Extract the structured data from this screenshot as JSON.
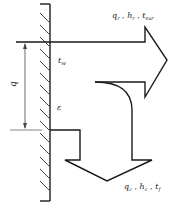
{
  "diagram": {
    "colors": {
      "stroke": "#1a1a1a",
      "hatch": "#333333",
      "dimension": "#444444",
      "background": "#ffffff"
    },
    "labels": {
      "radiation": "qᵣ , hᵣ , tₛᵤᵣ",
      "radiation_parts": {
        "q": "q",
        "q_sub": "r",
        "h": "h",
        "h_sub": "r",
        "t": "t",
        "t_sub": "sur"
      },
      "convection_parts": {
        "q": "q",
        "q_sub": "c",
        "h": "h",
        "h_sub": "c",
        "t": "t",
        "t_sub": "f"
      },
      "wall_temperature": {
        "t": "t",
        "t_sub": "w"
      },
      "emissivity": "ε",
      "dimension": "q"
    },
    "elements": {
      "wall": "vertical hatched wall",
      "radiation_arrow": "arrow to the right",
      "convection_arrow": "curved arrow turning downward",
      "dimension_line": "vertical dimension arrow labeled q"
    }
  }
}
